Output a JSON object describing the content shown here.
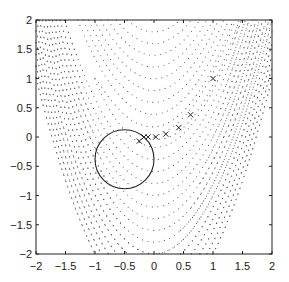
{
  "chart_data": {
    "type": "scatter",
    "title": "",
    "xlabel": "",
    "ylabel": "",
    "xlim": [
      -2,
      2
    ],
    "ylim": [
      -2,
      2
    ],
    "grid": false,
    "x_ticks": [
      "-2",
      "-1.5",
      "-1",
      "-0.5",
      "0",
      "0.5",
      "1",
      "1.5",
      "2"
    ],
    "y_ticks": [
      "2",
      "1.5",
      "1",
      "0.5",
      "0",
      "-0.5",
      "-1",
      "-1.5",
      "-2"
    ],
    "background": "dotted contour lines of a banana-shaped (Rosenbrock-like) function",
    "contour_function": "100*(y-x^2)^2+(1-x)^2",
    "contour_levels": [
      1,
      4,
      16,
      36,
      64,
      100,
      144,
      196,
      256,
      324,
      400,
      484,
      576,
      676,
      784,
      900
    ],
    "series": [
      {
        "name": "iterates",
        "marker": "x",
        "x": [
          -0.25,
          -0.17,
          -0.1,
          0.03,
          0.2,
          0.42,
          0.62,
          1.0
        ],
        "y": [
          -0.07,
          0.0,
          0.0,
          0.0,
          0.05,
          0.16,
          0.38,
          1.0
        ]
      }
    ],
    "circle": {
      "center": [
        -0.5,
        -0.38
      ],
      "radius": 0.5,
      "style": "solid"
    }
  },
  "colors": {
    "ink": "#222222",
    "dots": "#555555",
    "background": "#ffffff"
  }
}
